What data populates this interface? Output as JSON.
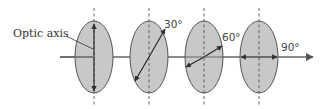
{
  "diagram": {
    "label": "Optic axis",
    "colors": {
      "plate_fill": "#c8c8c8",
      "plate_stroke": "#555555",
      "line": "#333333",
      "beam": "#555555"
    },
    "plates": [
      {
        "angle_label": "",
        "angle": 0
      },
      {
        "angle_label": "30°",
        "angle": 30
      },
      {
        "angle_label": "60°",
        "angle": 60
      },
      {
        "angle_label": "90°",
        "angle": 90
      }
    ]
  }
}
